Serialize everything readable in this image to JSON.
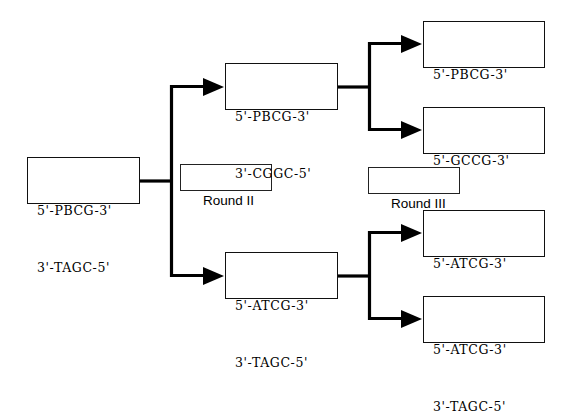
{
  "diagram": {
    "background_color": "#ffffff",
    "line_color": "#000000",
    "box_border_color": "#111111",
    "labels": {
      "round_two": "Round II",
      "round_three": "Round III"
    },
    "nodes": {
      "root": {
        "top_strand": "5'-PBCG-3'",
        "bottom_strand": "3'-TAGC-5'"
      },
      "round2_upper": {
        "top_strand": "5'-PBCG-3'",
        "bottom_strand": "3'-CGGC-5'"
      },
      "round2_lower": {
        "top_strand": "5'-ATCG-3'",
        "bottom_strand": "3'-TAGC-5'"
      },
      "round3_a": {
        "top_strand": "5'-PBCG-3'",
        "bottom_strand": "3'-CGGC-5'"
      },
      "round3_b": {
        "top_strand": "5'-GCCG-3'",
        "bottom_strand": "3'-CGGC-5'"
      },
      "round3_c": {
        "top_strand": "5'-ATCG-3'",
        "bottom_strand": "3'-TAGC-5'"
      },
      "round3_d": {
        "top_strand": "5'-ATCG-3'",
        "bottom_strand": "3'-TAGC-5'"
      }
    }
  }
}
